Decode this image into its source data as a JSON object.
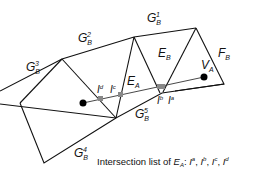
{
  "labels": {
    "g1": {
      "base": "G",
      "sub": "B",
      "sup": "1"
    },
    "g2": {
      "base": "G",
      "sub": "B",
      "sup": "2"
    },
    "g3": {
      "base": "G",
      "sub": "B",
      "sup": "3"
    },
    "g4": {
      "base": "G",
      "sub": "B",
      "sup": "4"
    },
    "g5": {
      "base": "G",
      "sub": "B",
      "sup": "5"
    },
    "ea": {
      "base": "E",
      "sub": "A"
    },
    "eb": {
      "base": "E",
      "sub": "B"
    },
    "fb": {
      "base": "F",
      "sub": "B"
    },
    "va": {
      "base": "V",
      "sub": "A"
    },
    "id": {
      "base": "I",
      "sup": "d"
    },
    "ic": {
      "base": "I",
      "sup": "c"
    },
    "ib": {
      "base": "I",
      "sup": "b"
    },
    "ia": {
      "base": "I",
      "sup": "a"
    }
  },
  "caption": {
    "prefix": "Intersection list of ",
    "subject_base": "E",
    "subject_sub": "A",
    "colon": ": ",
    "items": [
      {
        "base": "I",
        "sup": "a"
      },
      {
        "base": "I",
        "sup": "b"
      },
      {
        "base": "I",
        "sup": "c"
      },
      {
        "base": "I",
        "sup": "d"
      }
    ]
  },
  "colors": {
    "edge": "#111111",
    "intersection_marker": "#888888",
    "vertex": "#000000"
  }
}
